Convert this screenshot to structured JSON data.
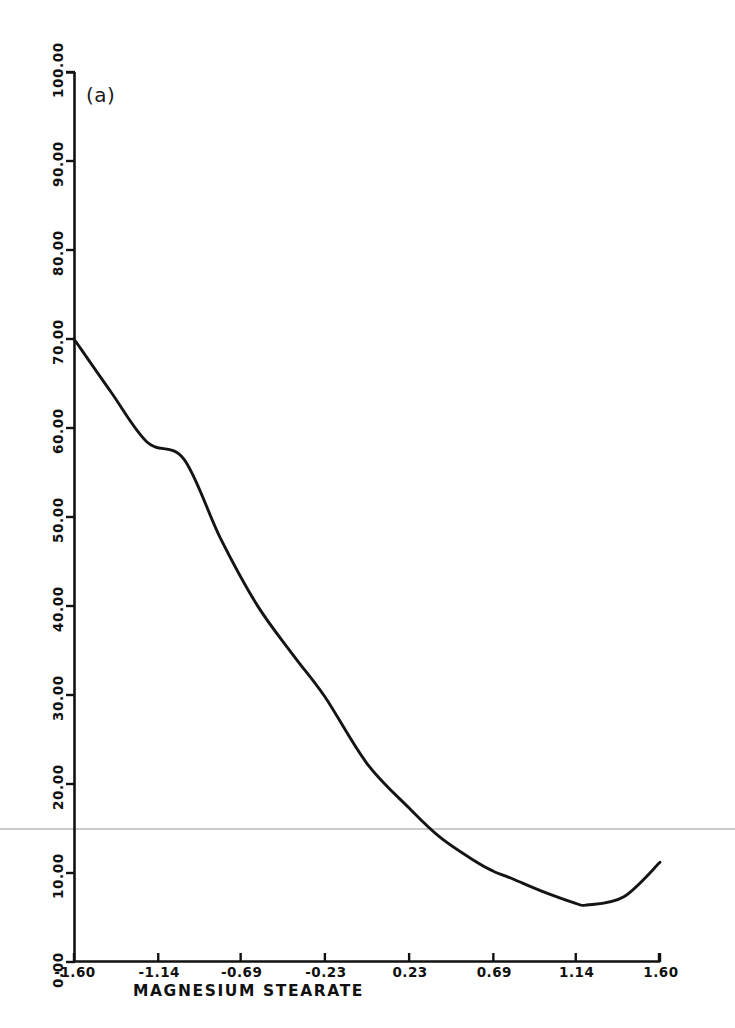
{
  "figure": {
    "panel_label": "(a)",
    "background_color": "#ffffff",
    "line_color": "#141414",
    "axis_color": "#111111",
    "artifact_line_color": "#b9b9b9"
  },
  "chart_data": {
    "type": "line",
    "title": "",
    "subtitle": "",
    "panel": "(a)",
    "xlabel": "MAGNESIUM STEARATE",
    "ylabel": "DISSOLUTION AT 30 MIN.",
    "xlim": [
      -1.6,
      1.6
    ],
    "ylim": [
      0.0,
      100.0
    ],
    "grid": false,
    "legend": null,
    "xticks": [
      -1.6,
      -1.14,
      -0.69,
      -0.23,
      0.23,
      0.69,
      1.14,
      1.6
    ],
    "xtick_labels": [
      "-1.60",
      "-1.14",
      "-0.69",
      "-0.23",
      "0.23",
      "0.69",
      "1.14",
      "1.60"
    ],
    "yticks": [
      0.0,
      10.0,
      20.0,
      30.0,
      40.0,
      50.0,
      60.0,
      70.0,
      80.0,
      90.0,
      100.0
    ],
    "ytick_labels": [
      "0.00",
      "10.00",
      "20.00",
      "30.00",
      "40.00",
      "50.00",
      "60.00",
      "70.00",
      "80.00",
      "90.00",
      "100.00"
    ],
    "series": [
      {
        "name": "Dissolution response curve",
        "shape": "quadratic (convex, minimum near x = 0.95)",
        "x": [
          -1.6,
          -1.4,
          -1.2,
          -1.0,
          -0.8,
          -0.6,
          -0.4,
          -0.23,
          0.0,
          0.23,
          0.4,
          0.6,
          0.69,
          0.8,
          0.95,
          1.14,
          1.2,
          1.4,
          1.6
        ],
        "y": [
          70.0,
          64.1,
          58.4,
          56.5,
          47.6,
          40.1,
          34.4,
          29.8,
          22.3,
          17.3,
          14.0,
          11.2,
          10.2,
          9.3,
          8.0,
          6.6,
          6.4,
          7.3,
          11.2
        ]
      }
    ],
    "annotations": [
      {
        "text": "(a)",
        "x": -1.52,
        "y": 91.0
      }
    ]
  }
}
